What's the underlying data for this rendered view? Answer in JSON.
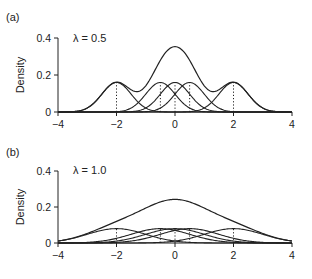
{
  "panels": [
    {
      "label": "(a)",
      "lambda_text": "λ = 0.5",
      "ylabel": "Density"
    },
    {
      "label": "(b)",
      "lambda_text": "λ = 1.0",
      "ylabel": "Density"
    }
  ],
  "chart_data": [
    {
      "type": "line",
      "title": "(a)",
      "annotation": "λ = 0.5",
      "xlabel": "",
      "ylabel": "Density",
      "xlim": [
        -4,
        4
      ],
      "ylim": [
        0,
        0.4
      ],
      "xticks": [
        -4,
        -2,
        0,
        2,
        4
      ],
      "yticks": [
        0,
        0.2,
        0.4
      ],
      "grid": false,
      "components": {
        "means": [
          -2,
          -0.5,
          0,
          0.5,
          2
        ],
        "weight": 0.2,
        "sd": 0.5
      },
      "series": [
        {
          "name": "component at -2",
          "peak": 0.16
        },
        {
          "name": "component at -0.5",
          "peak": 0.16
        },
        {
          "name": "component at 0",
          "peak": 0.16
        },
        {
          "name": "component at 0.5",
          "peak": 0.16
        },
        {
          "name": "component at 2",
          "peak": 0.16
        },
        {
          "name": "mixture density",
          "peak": 0.35
        }
      ],
      "dotted_verticals_at": [
        -2,
        -0.5,
        0,
        0.5,
        2
      ]
    },
    {
      "type": "line",
      "title": "(b)",
      "annotation": "λ = 1.0",
      "xlabel": "",
      "ylabel": "Density",
      "xlim": [
        -4,
        4
      ],
      "ylim": [
        0,
        0.4
      ],
      "xticks": [
        -4,
        -2,
        0,
        2,
        4
      ],
      "yticks": [
        0,
        0.2,
        0.4
      ],
      "grid": false,
      "components": {
        "means": [
          -2,
          -0.5,
          0,
          0.5,
          2
        ],
        "weight": 0.2,
        "sd": 1.0
      },
      "series": [
        {
          "name": "component at -2",
          "peak": 0.08
        },
        {
          "name": "component at -0.5",
          "peak": 0.08
        },
        {
          "name": "component at 0",
          "peak": 0.08
        },
        {
          "name": "component at 0.5",
          "peak": 0.08
        },
        {
          "name": "component at 2",
          "peak": 0.08
        },
        {
          "name": "mixture density",
          "peak": 0.24
        }
      ],
      "dotted_verticals_at": [
        -2,
        -0.5,
        0,
        0.5,
        2
      ]
    }
  ]
}
